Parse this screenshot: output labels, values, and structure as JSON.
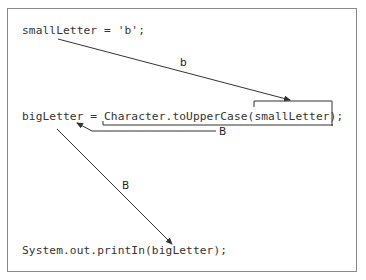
{
  "diagram": {
    "code_lines": [
      "smallLetter = 'b';",
      "bigLetter = Character.toUpperCase(smallLetter);",
      "System.out.printIn(bigLetter);"
    ],
    "arrow_labels": {
      "small_to_arg": "b",
      "return_value": "B",
      "big_to_print": "B"
    },
    "colors": {
      "border": "#8a8a8a",
      "line": "#333333",
      "text": "#333333"
    }
  }
}
